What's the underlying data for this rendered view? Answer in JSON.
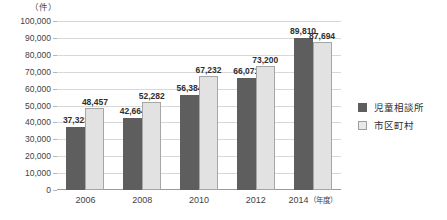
{
  "top_caption": "",
  "chart_data": {
    "type": "bar",
    "title": "",
    "xlabel": "年度",
    "ylabel": "",
    "unit_label": "（件）",
    "categories": [
      "2006",
      "2008",
      "2010",
      "2012",
      "2014"
    ],
    "xtick_suffix": "（年度）",
    "ylim": [
      0,
      100000
    ],
    "yticks": [
      "100,000",
      "90,000",
      "80,000",
      "70,000",
      "60,000",
      "50,000",
      "40,000",
      "30,000",
      "20,000",
      "10,000",
      "0"
    ],
    "ytick_values": [
      100000,
      90000,
      80000,
      70000,
      60000,
      50000,
      40000,
      30000,
      20000,
      10000,
      0
    ],
    "grid": true,
    "legend_position": "right",
    "series": [
      {
        "name": "児童相談所",
        "color": "#5e5e5e",
        "values": [
          37323,
          42664,
          56384,
          66071,
          89810
        ],
        "labels": [
          "37,323",
          "42,664",
          "56,384",
          "66,071",
          "89,810"
        ]
      },
      {
        "name": "市区町村",
        "color": "#e2e2e2",
        "values": [
          48457,
          52282,
          67232,
          73200,
          87694
        ],
        "labels": [
          "48,457",
          "52,282",
          "67,232",
          "73,200",
          "87,694"
        ]
      }
    ]
  }
}
